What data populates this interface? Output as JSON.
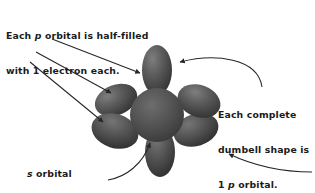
{
  "figure": {
    "background_color": "#ffffff",
    "ink_color": "#1a1a1a",
    "lobe_color_dark": "#3d3d3d",
    "lobe_color_mid": "#5a5a5a",
    "lobe_color_light": "#8a8a8a",
    "sphere_color": "#4f4f4f"
  },
  "callouts": {
    "top_left": {
      "line1_a": "Each ",
      "line1_i": "p",
      "line1_b": " orbital is half-filled",
      "line2": "with 1 electron each."
    },
    "right": {
      "line1": "Each complete",
      "line2": "dumbell shape is",
      "line3_a": "1 ",
      "line3_i": "p",
      "line3_b": " orbital."
    },
    "bottom_left": {
      "line1_i": "s",
      "line1_b": " orbital",
      "line2": "filled with 2",
      "line3": "electrons"
    }
  },
  "diagram": {
    "center_sphere_label": "s-orbital-sphere",
    "lobes": [
      {
        "name": "p-lobe-top",
        "angle_deg": 0,
        "length": 46,
        "width": 27
      },
      {
        "name": "p-lobe-bottom",
        "angle_deg": 180,
        "length": 46,
        "width": 27
      },
      {
        "name": "p-lobe-upper-left",
        "angle_deg": -65,
        "length": 38,
        "width": 26
      },
      {
        "name": "p-lobe-upper-right",
        "angle_deg": 65,
        "length": 38,
        "width": 26
      },
      {
        "name": "p-lobe-lower-left",
        "angle_deg": -115,
        "length": 40,
        "width": 28
      },
      {
        "name": "p-lobe-lower-right",
        "angle_deg": 115,
        "length": 40,
        "width": 28
      }
    ],
    "arrow_count": 6
  }
}
